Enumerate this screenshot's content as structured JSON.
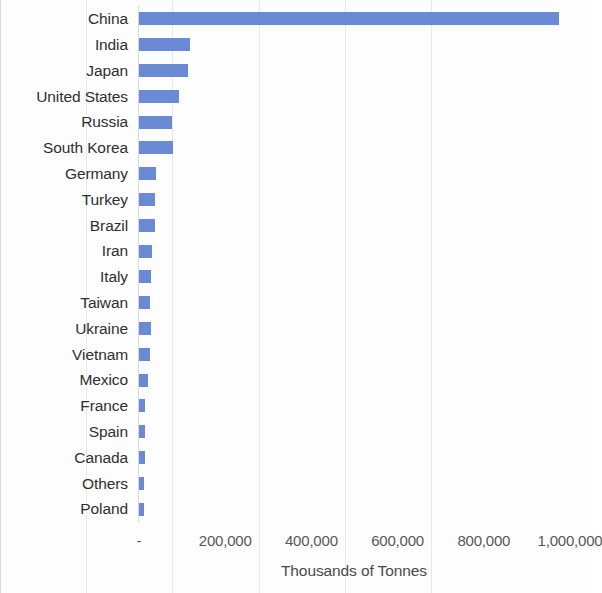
{
  "chart_data": {
    "type": "bar",
    "orientation": "horizontal",
    "title": "",
    "xlabel": "Thousands of Tonnes",
    "ylabel": "",
    "xlim": [
      0,
      1000000
    ],
    "xticks": [
      0,
      200000,
      400000,
      600000,
      800000,
      1000000
    ],
    "xtick_labels": [
      "-",
      "200,000",
      "400,000",
      "600,000",
      "800,000",
      "1,000,000"
    ],
    "grid": "vertical",
    "legend": "none",
    "bar_color": "#6b8ad6",
    "categories": [
      "China",
      "India",
      "Japan",
      "United States",
      "Russia",
      "South Korea",
      "Germany",
      "Turkey",
      "Brazil",
      "Iran",
      "Italy",
      "Taiwan",
      "Ukraine",
      "Vietnam",
      "Mexico",
      "France",
      "Spain",
      "Canada",
      "Others",
      "Poland"
    ],
    "values": [
      975000,
      118000,
      113000,
      93000,
      76000,
      79000,
      40000,
      36000,
      37000,
      31000,
      28000,
      26000,
      27000,
      25000,
      20000,
      15000,
      13000,
      14000,
      11000,
      12000
    ]
  },
  "axis": {
    "x_title": "Thousands of Tonnes"
  }
}
